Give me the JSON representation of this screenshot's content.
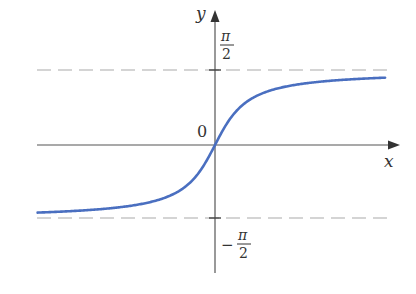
{
  "chart_data": {
    "type": "line",
    "title": "",
    "function": "y = arctan(x)",
    "xlabel": "x",
    "ylabel": "y",
    "origin_label": "0",
    "series": [
      {
        "name": "arctan(x)",
        "color": "#4a6fc0",
        "x": [
          -7,
          -6,
          -5,
          -4,
          -3,
          -2,
          -1,
          -0.5,
          0,
          0.5,
          1,
          2,
          3,
          4,
          5,
          6,
          7
        ],
        "values": [
          -1.429,
          -1.406,
          -1.373,
          -1.326,
          -1.249,
          -1.107,
          -0.785,
          -0.464,
          0,
          0.464,
          0.785,
          1.107,
          1.249,
          1.326,
          1.373,
          1.406,
          1.429
        ]
      }
    ],
    "asymptotes": [
      {
        "value": 1.5708,
        "label_num": "π",
        "label_den": "2",
        "sign": "",
        "style": "dashed"
      },
      {
        "value": -1.5708,
        "label_num": "π",
        "label_den": "2",
        "sign": "−",
        "style": "dashed"
      }
    ],
    "xlim": [
      -7.3,
      7.0
    ],
    "ylim": [
      -2.2,
      2.4
    ],
    "grid": false,
    "legend": null
  },
  "colors": {
    "curve": "#4a6fc0",
    "axis": "#555555",
    "asymptote": "#aaaaaa",
    "text": "#333333"
  }
}
